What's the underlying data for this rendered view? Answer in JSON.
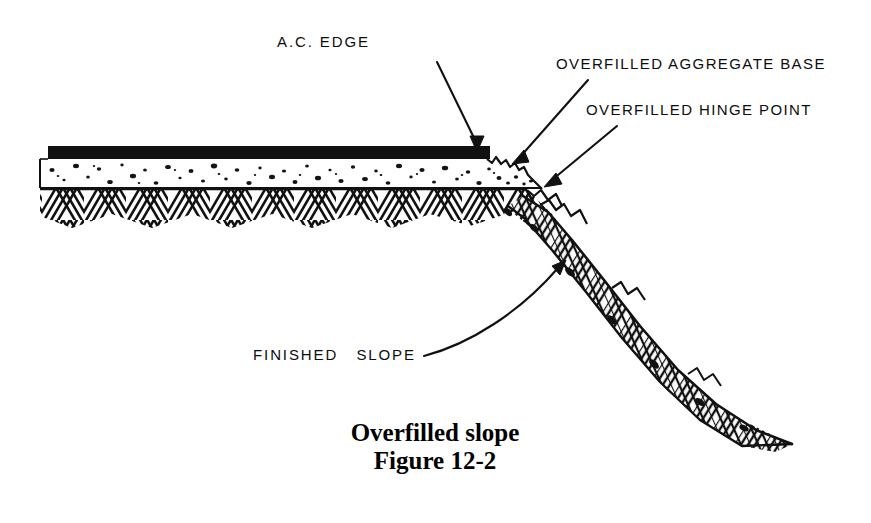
{
  "figure": {
    "caption_title": "Overfilled slope",
    "caption_number": "Figure 12-2",
    "background_color": "#ffffff",
    "ink_color": "#111111"
  },
  "annotations": [
    {
      "id": "ac-edge",
      "label": "A.C. EDGE",
      "text_x": 277,
      "text_y": 47,
      "leader_start": [
        437,
        62
      ],
      "leader_end": [
        477,
        150
      ],
      "arrow_angle_deg": 66
    },
    {
      "id": "overfilled-aggregate-base",
      "label": "OVERFILLED AGGREGATE BASE",
      "text_x": 556,
      "text_y": 69,
      "leader_start": [
        588,
        80
      ],
      "leader_end": [
        512,
        163
      ],
      "arrow_angle_deg": 228
    },
    {
      "id": "overfilled-hinge-point",
      "label": "OVERFILLED HINGE POINT",
      "text_x": 586,
      "text_y": 115,
      "leader_start": [
        617,
        126
      ],
      "leader_end": [
        544,
        186
      ],
      "arrow_angle_deg": 219
    },
    {
      "id": "finished-slope",
      "label": "FINISHED   SLOPE",
      "text_x": 253,
      "text_y": 360,
      "leader_start": [
        424,
        356
      ],
      "leader_end": [
        566,
        261
      ],
      "arrow_angle_deg": 326
    }
  ],
  "cross_section": {
    "layers": [
      {
        "name": "asphalt-concrete-layer",
        "description": "A.C. surface course, solid black",
        "color": "#111111",
        "x_start": 48,
        "x_end": 490,
        "y_top": 146,
        "y_bottom": 159
      },
      {
        "name": "aggregate-base-layer",
        "description": "Aggregate base, white with dark speckles",
        "color": "#ffffff",
        "speckle_color": "#141414",
        "x_start": 40,
        "x_end": 520,
        "y_top": 159,
        "y_bottom": 188
      },
      {
        "name": "subgrade-layer",
        "description": "Native subgrade, herringbone hatch",
        "hatch_color": "#111111",
        "x_start": 40,
        "y_top": 190,
        "y_bottom": 228
      }
    ],
    "hinge_point": [
      541,
      188
    ],
    "slope_toe": [
      790,
      440
    ],
    "slope_band_description": "Hatched fill slope descending from hinge point to toe"
  }
}
